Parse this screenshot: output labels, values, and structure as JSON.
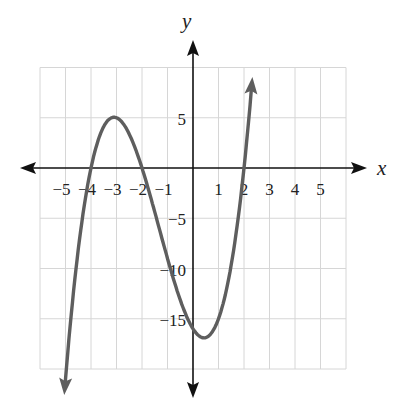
{
  "chart_data": {
    "type": "line",
    "title": "",
    "xlabel": "x",
    "ylabel": "y",
    "function": "f(x) = (x + 4)(x + 2)(x - 2) = x^3 + 4x^2 - 4x - 16",
    "xlim": [
      -6,
      6
    ],
    "ylim": [
      -20,
      10
    ],
    "grid": true,
    "x_grid_step": 1,
    "y_grid_step": 5,
    "x_ticks": [
      -5,
      -4,
      -3,
      -2,
      -1,
      1,
      2,
      3,
      4,
      5
    ],
    "x_tick_labels": [
      "−5",
      "−4",
      "−3",
      "−2",
      "−1",
      "1",
      "2",
      "3",
      "4",
      "5"
    ],
    "y_ticks": [
      5,
      -5,
      -10,
      -15
    ],
    "y_tick_labels": [
      "5",
      "−5",
      "−10",
      "−15"
    ],
    "curve_domain": [
      -5.05,
      2.33
    ],
    "curve_end_arrows": true,
    "key_points": [
      {
        "label": "x-intercept",
        "x": -4,
        "y": 0
      },
      {
        "label": "local max",
        "x": -3,
        "y": 5
      },
      {
        "label": "x-intercept",
        "x": -2,
        "y": 0
      },
      {
        "label": "y-intercept",
        "x": 0,
        "y": -16
      },
      {
        "label": "local min",
        "x": 0.43,
        "y": -16.9
      },
      {
        "label": "x-intercept",
        "x": 2,
        "y": 0
      }
    ],
    "series": [
      {
        "name": "f(x)",
        "x": [
          -5.05,
          -5,
          -4.5,
          -4,
          -3.5,
          -3,
          -2.5,
          -2,
          -1.5,
          -1,
          -0.5,
          0,
          0.43,
          1,
          1.5,
          2,
          2.33
        ],
        "values": [
          -19.2,
          -18,
          -8.1,
          0,
          4.1,
          5,
          3.4,
          0,
          -4.4,
          -9,
          -13.1,
          -16,
          -16.9,
          -15,
          -9.6,
          0,
          9.1
        ]
      }
    ],
    "colors": {
      "curve": "#5e5e5e",
      "axes": "#111111",
      "grid": "#d6d6d6",
      "background": "#ffffff"
    }
  }
}
